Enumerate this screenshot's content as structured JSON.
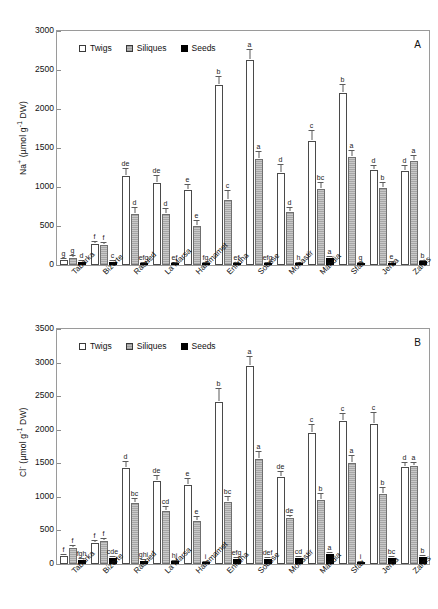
{
  "figure": {
    "categories": [
      "Tabarka",
      "Bizerte",
      "Raoued",
      "La Marsa",
      "Hammamet",
      "Enfidha",
      "Sousse",
      "Monastir",
      "Mahdia",
      "Sfax",
      "Jerba",
      "Zarzis"
    ],
    "legend": [
      "Twigs",
      "Siliques",
      "Seeds"
    ],
    "colors": {
      "twigs": "#ffffff",
      "siliques": "#bdbdbd",
      "seeds": "#000000",
      "axis": "#9a9a9a"
    }
  },
  "chart_data": [
    {
      "type": "bar",
      "panel": "A",
      "title": "",
      "xlabel": "",
      "ylabel": "Na+ (µmol g-1 DW)",
      "ylabel_html": "Na<sup>+</sup> (&#181;mol g<sup>-1</sup> DW)",
      "ylim": [
        0,
        3000
      ],
      "yticks": [
        0,
        500,
        1000,
        1500,
        2000,
        2500,
        3000
      ],
      "grid": false,
      "legend_position": "top-left",
      "categories": [
        "Tabarka",
        "Bizerte",
        "Raoued",
        "La Marsa",
        "Hammamet",
        "Enfidha",
        "Sousse",
        "Monastir",
        "Mahdia",
        "Sfax",
        "Jerba",
        "Zarzis"
      ],
      "series": [
        {
          "name": "Twigs",
          "values": [
            65,
            265,
            1140,
            1055,
            965,
            2310,
            2630,
            1180,
            1595,
            2200,
            1215,
            1210
          ],
          "errors": [
            18,
            25,
            90,
            90,
            55,
            105,
            125,
            100,
            120,
            105,
            55,
            60
          ],
          "letters": [
            "g",
            "f",
            "de",
            "de",
            "e",
            "b",
            "a",
            "d",
            "c",
            "b",
            "d",
            "d"
          ]
        },
        {
          "name": "Siliques",
          "values": [
            95,
            260,
            660,
            660,
            495,
            835,
            1365,
            675,
            980,
            1380,
            990,
            1330
          ],
          "errors": [
            20,
            25,
            75,
            60,
            65,
            110,
            85,
            50,
            75,
            80,
            60,
            70
          ],
          "letters": [
            "g",
            "f",
            "d",
            "d",
            "e",
            "c",
            "a",
            "d",
            "bc",
            "a",
            "b",
            "a"
          ]
        },
        {
          "name": "Seeds",
          "values": [
            42,
            45,
            20,
            22,
            20,
            22,
            18,
            10,
            85,
            12,
            28,
            48
          ],
          "errors": [
            8,
            8,
            5,
            5,
            5,
            5,
            4,
            3,
            12,
            3,
            6,
            8
          ],
          "letters": [
            "d",
            "c",
            "efg",
            "ef",
            "fg",
            "ef",
            "efg",
            "h",
            "a",
            "g",
            "e",
            "b"
          ]
        }
      ]
    },
    {
      "type": "bar",
      "panel": "B",
      "title": "",
      "xlabel": "",
      "ylabel": "Cl- (µmol g-1 DW)",
      "ylabel_html": "Cl<sup>-</sup> (&#181;mol g<sup>-1</sup> DW)",
      "ylim": [
        0,
        3500
      ],
      "yticks": [
        0,
        500,
        1000,
        1500,
        2000,
        2500,
        3000,
        3500
      ],
      "grid": false,
      "legend_position": "top-left",
      "categories": [
        "Tabarka",
        "Bizerte",
        "Raoued",
        "La Marsa",
        "Hammamet",
        "Enfidha",
        "Sousse",
        "Monastir",
        "Mahdia",
        "Sfax",
        "Jerba",
        "Zarzis"
      ],
      "series": [
        {
          "name": "Twigs",
          "values": [
            120,
            310,
            1425,
            1240,
            1180,
            2420,
            2950,
            1300,
            1955,
            2130,
            2090,
            1450
          ],
          "errors": [
            20,
            30,
            100,
            70,
            80,
            180,
            140,
            70,
            110,
            110,
            160,
            60
          ],
          "letters": [
            "f",
            "f",
            "d",
            "de",
            "e",
            "b",
            "a",
            "de",
            "c",
            "c",
            "c",
            "d"
          ]
        },
        {
          "name": "Siliques",
          "values": [
            235,
            350,
            915,
            795,
            640,
            920,
            1560,
            680,
            960,
            1500,
            1045,
            1455
          ],
          "errors": [
            35,
            30,
            60,
            60,
            65,
            85,
            110,
            40,
            90,
            105,
            85,
            55
          ],
          "letters": [
            "f",
            "f",
            "bc",
            "cd",
            "e",
            "bc",
            "a",
            "de",
            "b",
            "a",
            "b",
            "a"
          ]
        },
        {
          "name": "Seeds",
          "values": [
            65,
            95,
            45,
            40,
            30,
            75,
            75,
            90,
            150,
            25,
            95,
            110
          ],
          "errors": [
            10,
            12,
            8,
            8,
            6,
            10,
            10,
            12,
            20,
            6,
            12,
            14
          ],
          "letters": [
            "fgh",
            "cde",
            "ghi",
            "hi",
            "i",
            "efg",
            "def",
            "cd",
            "a",
            "i",
            "bc",
            "b"
          ]
        }
      ]
    }
  ]
}
